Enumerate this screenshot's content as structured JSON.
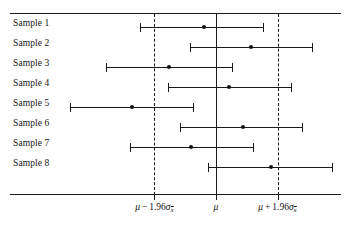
{
  "chart_data": {
    "type": "scatter",
    "title": "",
    "xlabel": "",
    "ylabel": "",
    "orientation": "horizontal",
    "grid": false,
    "legend": null,
    "xlim": [
      -3.4,
      3.8
    ],
    "x_reference_lines": [
      {
        "name": "lower-limit",
        "value": -1.96,
        "style": "dashed",
        "label_parts": {
          "mu": "μ",
          "op": "−",
          "coef": "1.96",
          "sigma": "σ",
          "subscript": "x̄"
        }
      },
      {
        "name": "mean",
        "value": 0.0,
        "style": "solid",
        "label_parts": {
          "mu": "μ"
        }
      },
      {
        "name": "upper-limit",
        "value": 1.96,
        "style": "dashed",
        "label_parts": {
          "mu": "μ",
          "op": "+",
          "coef": "1.96",
          "sigma": "σ",
          "subscript": "x̄"
        }
      }
    ],
    "tick_labels": [
      "μ − 1.96σx̄",
      "μ",
      "μ + 1.96σx̄"
    ],
    "tick_values": [
      -1.96,
      0.0,
      1.96
    ],
    "categories": [
      "Sample 1",
      "Sample 2",
      "Sample 3",
      "Sample 4",
      "Sample 5",
      "Sample 6",
      "Sample 7",
      "Sample 8"
    ],
    "intervals": [
      {
        "label": "Sample 1",
        "lower": -2.42,
        "point": -0.38,
        "upper": 1.53,
        "contains_mu": true
      },
      {
        "label": "Sample 2",
        "lower": -0.83,
        "point": 1.11,
        "upper": 3.09,
        "contains_mu": true
      },
      {
        "label": "Sample 3",
        "lower": -3.5,
        "point": -1.5,
        "upper": 0.54,
        "contains_mu": true
      },
      {
        "label": "Sample 4",
        "lower": -1.53,
        "point": 0.41,
        "upper": 2.42,
        "contains_mu": true
      },
      {
        "label": "Sample 5",
        "lower": -4.65,
        "point": -2.68,
        "upper": -0.7,
        "contains_mu": false
      },
      {
        "label": "Sample 6",
        "lower": -1.15,
        "point": 0.86,
        "upper": 2.77,
        "contains_mu": true
      },
      {
        "label": "Sample 7",
        "lower": -2.74,
        "point": -0.8,
        "upper": 1.21,
        "contains_mu": true
      },
      {
        "label": "Sample 8",
        "lower": -0.25,
        "point": 1.75,
        "upper": 3.73,
        "contains_mu": true
      }
    ],
    "note": "Eight sample confidence intervals plotted against the population mean; Sample 5 fails to capture mu."
  },
  "colors": {
    "ink": "#1a1a1a",
    "background": "#ffffff",
    "point": "#111111"
  }
}
